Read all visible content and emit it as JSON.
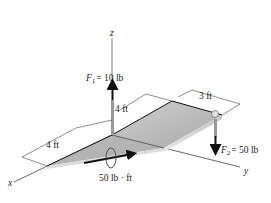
{
  "diagram": {
    "axes": {
      "x": "x",
      "y": "y",
      "z": "z"
    },
    "forces": [
      {
        "name": "F",
        "sub": "1",
        "value": "= 10 lb",
        "direction": "up"
      },
      {
        "name": "F",
        "sub": "2",
        "value": "= 50 lb",
        "direction": "down"
      }
    ],
    "couple_moment": "50 lb · ft",
    "dimensions": {
      "height": "4 ft",
      "length": "4 ft",
      "width": "3 ft"
    },
    "colors": {
      "plate_top": "#b8b8b8",
      "plate_front": "#d8d8d8",
      "line": "#222222",
      "axis": "#555555"
    }
  }
}
